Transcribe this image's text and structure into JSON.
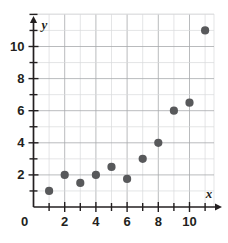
{
  "chart_data": {
    "type": "scatter",
    "title": "",
    "xlabel": "x",
    "ylabel": "y",
    "xlim": [
      0,
      11.6
    ],
    "ylim": [
      0,
      11.8
    ],
    "grid": true,
    "legend": null,
    "x_ticks_major": [
      2,
      4,
      6,
      8,
      10
    ],
    "x_ticks_minor": [
      1,
      3,
      5,
      7,
      9,
      11
    ],
    "y_ticks_major": [
      2,
      4,
      6,
      8,
      10
    ],
    "y_ticks_minor": [
      1,
      3,
      5,
      7,
      9,
      11
    ],
    "origin_label": "0",
    "x_tick_labels": [
      "2",
      "4",
      "6",
      "8",
      "10"
    ],
    "y_tick_labels": [
      "2",
      "4",
      "6",
      "8",
      "10"
    ],
    "point_color": "#58595b",
    "grid_color": "#d9dadb",
    "axis_color": "#231f20",
    "points": [
      {
        "x": 1,
        "y": 1
      },
      {
        "x": 2,
        "y": 2
      },
      {
        "x": 3,
        "y": 1.5
      },
      {
        "x": 4,
        "y": 2
      },
      {
        "x": 5,
        "y": 2.5
      },
      {
        "x": 6,
        "y": 1.75
      },
      {
        "x": 7,
        "y": 3
      },
      {
        "x": 8,
        "y": 4
      },
      {
        "x": 9,
        "y": 6
      },
      {
        "x": 10,
        "y": 6.5
      },
      {
        "x": 11,
        "y": 11
      }
    ]
  }
}
